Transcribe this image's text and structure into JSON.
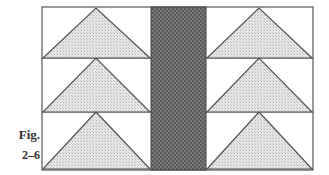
{
  "caption": {
    "label": "Fig.",
    "number": "2–6"
  },
  "diagram": {
    "rows": 3,
    "columns": 2,
    "colors": {
      "outline": "#555555",
      "triangle_fill": "#d9d9d9",
      "stripe_fill": "#6e6e6e",
      "background": "#ffffff"
    }
  }
}
